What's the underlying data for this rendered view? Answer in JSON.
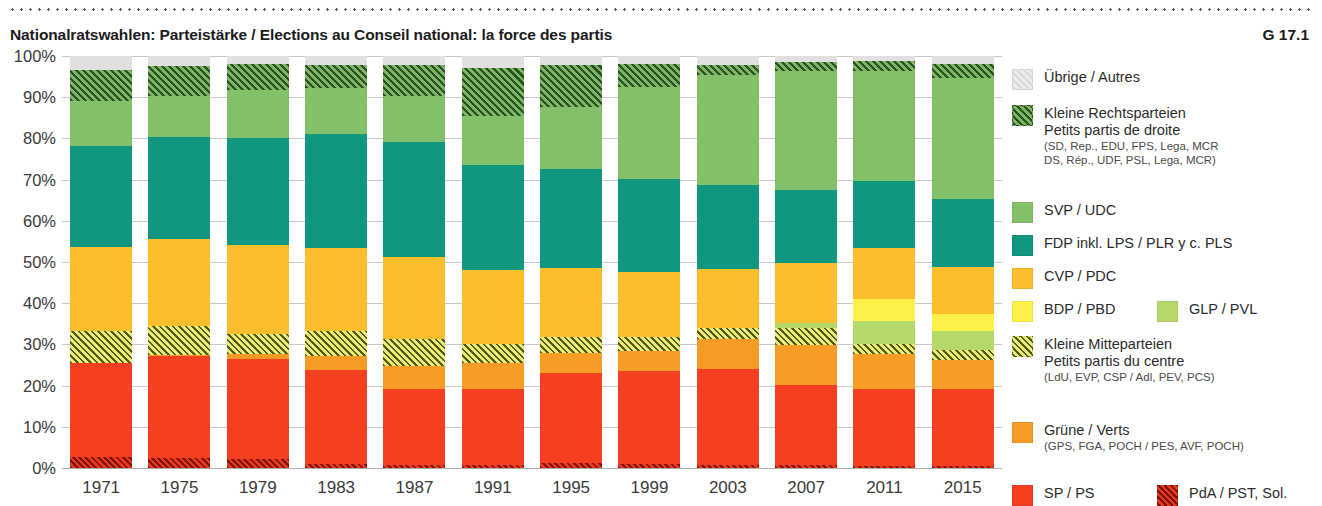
{
  "header": {
    "title": "Nationalratswahlen: Parteistärke / Elections au Conseil national: la force des partis",
    "code": "G 17.1"
  },
  "axes": {
    "y_ticks": [
      "100%",
      "90%",
      "80%",
      "70%",
      "60%",
      "50%",
      "40%",
      "30%",
      "20%",
      "10%",
      "0%"
    ],
    "x_ticks": [
      "1971",
      "1975",
      "1979",
      "1983",
      "1987",
      "1991",
      "1995",
      "1999",
      "2003",
      "2007",
      "2011",
      "2015"
    ]
  },
  "legend": {
    "items": [
      {
        "key": "uebrige",
        "label": "Übrige / Autres",
        "sub1": "",
        "sub2": "",
        "sub3": "",
        "color": "#e0e0e0"
      },
      {
        "key": "kl_rechts",
        "label": "Kleine Rechtsparteien",
        "sub1": "Petits partis de droite",
        "sub2": "(SD, Rep., EDU, FPS, Lega, MCR",
        "sub3": "DS, Rép., UDF, PSL, Lega, MCR)",
        "color": "#7fb468"
      },
      {
        "key": "svp",
        "label": "SVP / UDC",
        "sub1": "",
        "sub2": "",
        "sub3": "",
        "color": "#83c06a"
      },
      {
        "key": "fdp",
        "label": "FDP inkl. LPS / PLR y c. PLS",
        "sub1": "",
        "sub2": "",
        "sub3": "",
        "color": "#11977f"
      },
      {
        "key": "cvp",
        "label": "CVP / PDC",
        "sub1": "",
        "sub2": "",
        "sub3": "",
        "color": "#fcbe2c"
      },
      {
        "key": "bdp",
        "label": "BDP / PBD",
        "sub1": "",
        "sub2": "",
        "sub3": "",
        "color": "#fcf049"
      },
      {
        "key": "glp",
        "label": "GLP / PVL",
        "sub1": "",
        "sub2": "",
        "sub3": "",
        "color": "#b4d86a"
      },
      {
        "key": "kl_mitte",
        "label": "Kleine Mitteparteien",
        "sub1": "Petits partis du centre",
        "sub2": "(LdU, EVP, CSP / Adl, PEV, PCS)",
        "sub3": "",
        "color": "#ecea72"
      },
      {
        "key": "gruene",
        "label": "Grüne / Verts",
        "sub1": "(GPS, FGA, POCH / PES, AVF, POCH)",
        "sub2": "",
        "sub3": "",
        "color": "#f89c26"
      },
      {
        "key": "sp",
        "label": "SP / PS",
        "sub1": "",
        "sub2": "",
        "sub3": "",
        "color": "#f43f21"
      },
      {
        "key": "pda",
        "label": "PdA / PST, Sol.",
        "sub1": "",
        "sub2": "",
        "sub3": "",
        "color": "#e8381b"
      }
    ]
  },
  "chart_data": {
    "type": "bar",
    "stacked": true,
    "title": "Nationalratswahlen: Parteistärke / Elections au Conseil national: la force des partis",
    "xlabel": "",
    "ylabel": "",
    "ylim": [
      0,
      100
    ],
    "grid": true,
    "legend_position": "right",
    "categories": [
      "1971",
      "1975",
      "1979",
      "1983",
      "1987",
      "1991",
      "1995",
      "1999",
      "2003",
      "2007",
      "2011",
      "2015"
    ],
    "series": [
      {
        "name": "PdA / PST, Sol.",
        "key": "pda",
        "color": "#e8381b",
        "hatched": true,
        "values": [
          2.6,
          2.4,
          2.1,
          0.9,
          0.8,
          0.8,
          1.2,
          1.0,
          0.7,
          0.7,
          0.5,
          0.4
        ]
      },
      {
        "name": "SP / PS",
        "key": "sp",
        "color": "#f43f21",
        "hatched": false,
        "values": [
          22.9,
          24.9,
          24.4,
          22.8,
          18.4,
          18.5,
          21.8,
          22.5,
          23.3,
          19.5,
          18.7,
          18.8
        ]
      },
      {
        "name": "Grüne / Verts",
        "key": "gruene",
        "color": "#f89c26",
        "hatched": false,
        "values": [
          0.1,
          0.2,
          1.1,
          3.5,
          5.6,
          6.1,
          5.0,
          5.0,
          7.4,
          9.6,
          8.4,
          7.1
        ]
      },
      {
        "name": "Kleine Mitteparteien",
        "key": "kl_mitte",
        "color": "#ecea72",
        "hatched": true,
        "values": [
          7.6,
          6.9,
          5.0,
          6.1,
          6.5,
          4.6,
          3.8,
          3.2,
          2.6,
          4.1,
          2.6,
          2.3
        ]
      },
      {
        "name": "GLP / PVL",
        "key": "glp",
        "color": "#b4d86a",
        "hatched": false,
        "values": [
          0,
          0,
          0,
          0,
          0,
          0,
          0,
          0,
          0,
          1.4,
          5.4,
          4.6
        ]
      },
      {
        "name": "BDP / PBD",
        "key": "bdp",
        "color": "#fcf049",
        "hatched": false,
        "values": [
          0,
          0,
          0,
          0,
          0,
          0,
          0,
          0,
          0,
          0,
          5.4,
          4.1
        ]
      },
      {
        "name": "CVP / PDC",
        "key": "cvp",
        "color": "#fcbe2c",
        "hatched": false,
        "values": [
          20.4,
          21.1,
          21.5,
          20.2,
          20.0,
          18.0,
          16.8,
          15.9,
          14.4,
          14.5,
          12.3,
          11.6
        ]
      },
      {
        "name": "FDP inkl. LPS / PLR y c. PLS",
        "key": "fdp",
        "color": "#11977f",
        "hatched": false,
        "values": [
          24.5,
          24.8,
          26.1,
          27.7,
          27.9,
          25.6,
          24.1,
          22.5,
          20.2,
          17.7,
          16.5,
          16.4
        ]
      },
      {
        "name": "SVP / UDC",
        "key": "svp",
        "color": "#83c06a",
        "hatched": false,
        "values": [
          11.1,
          9.9,
          11.6,
          11.1,
          11.0,
          11.9,
          14.9,
          22.5,
          26.7,
          28.9,
          26.6,
          29.4
        ]
      },
      {
        "name": "Kleine Rechtsparteien",
        "key": "kl_rechts",
        "color": "#7fb468",
        "hatched": true,
        "values": [
          7.5,
          7.3,
          6.3,
          5.6,
          7.7,
          11.5,
          10.2,
          5.5,
          2.5,
          2.1,
          2.3,
          3.3
        ]
      },
      {
        "name": "Übrige / Autres",
        "key": "uebrige",
        "color": "#e0e0e0",
        "hatched": false,
        "values": [
          3.3,
          2.5,
          1.9,
          2.1,
          2.1,
          3.0,
          2.2,
          1.9,
          2.2,
          1.5,
          1.3,
          2.0
        ]
      }
    ]
  }
}
